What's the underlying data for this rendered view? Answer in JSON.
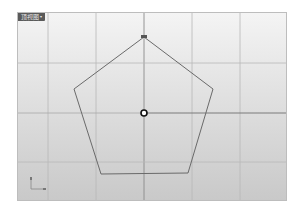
{
  "viewport": {
    "label": "顶视图",
    "dropdown_icon": "▾",
    "background_top": "#f4f4f4",
    "background_bottom": "#c9c9c9"
  },
  "grid": {
    "minor_color": "#b8b8b8",
    "axis_color": "#8a8a8a",
    "vertical_lines_x": [
      30,
      78,
      126,
      174,
      222
    ],
    "horizontal_lines_y": [
      50,
      100,
      149
    ],
    "axis_x": 126,
    "axis_y": 100
  },
  "geometry": {
    "shape": "pentagon",
    "stroke_color": "#6a6a6a",
    "points": "126,24 195,76 170,160 83,161 56,76",
    "origin_marker": {
      "cx": 126,
      "cy": 100
    }
  },
  "axis_widget": {
    "x_label": "x",
    "y_label": "y"
  }
}
